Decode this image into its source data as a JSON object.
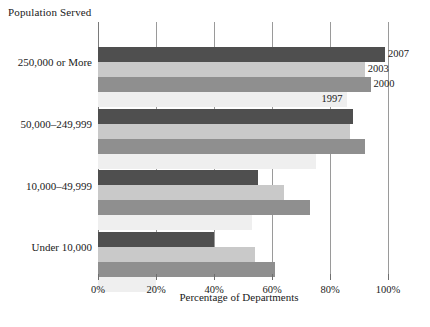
{
  "chart_data": {
    "type": "bar",
    "orientation": "horizontal",
    "title": "",
    "xlabel": "Percentage of Departments",
    "ylabel": "Population Served",
    "xlim": [
      0,
      100
    ],
    "xticks": [
      "0%",
      "20%",
      "40%",
      "60%",
      "80%",
      "100%"
    ],
    "xtick_values": [
      0,
      20,
      40,
      60,
      80,
      100
    ],
    "grid": true,
    "legend_position": "inline-annotations-right-of-first-group",
    "categories": [
      "250,000 or More",
      "50,000–249,999",
      "10,000–49,999",
      "Under 10,000"
    ],
    "series": [
      {
        "name": "2007",
        "color": "#4f4f4f",
        "values": [
          99,
          88,
          55,
          40
        ]
      },
      {
        "name": "2003",
        "color": "#c9c9c9",
        "values": [
          92,
          87,
          64,
          54
        ]
      },
      {
        "name": "2000",
        "color": "#8f8f8f",
        "values": [
          94,
          92,
          73,
          61
        ]
      },
      {
        "name": "1997",
        "color": "#efefef",
        "values": [
          86,
          75,
          53,
          20
        ]
      }
    ],
    "annotations": [
      {
        "label": "2007",
        "series": "2007"
      },
      {
        "label": "2003",
        "series": "2003"
      },
      {
        "label": "2000",
        "series": "2000"
      },
      {
        "label": "1997",
        "series": "1997"
      }
    ]
  },
  "axis": {
    "population_title": "Population Served",
    "caption": "Percentage of Departments"
  }
}
